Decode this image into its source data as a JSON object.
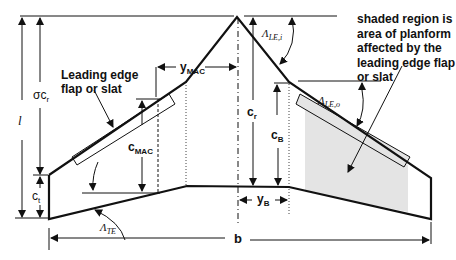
{
  "figure": {
    "type": "wing planform diagram (cranked delta with leading edge flap/slat)",
    "colors": {
      "line": "#111111",
      "shade": "#e6e6e6",
      "background": "#ffffff"
    }
  },
  "annotations": {
    "flap_label": [
      "Leading edge",
      "flap or slat"
    ],
    "shaded_note": [
      "shaded region is",
      "area of planform",
      "affected by the",
      "leading edge flap",
      "or slat"
    ]
  },
  "dimensions": {
    "l": "l",
    "sigma_cr": {
      "sym": "σc",
      "sub": "r"
    },
    "ct": {
      "sym": "c",
      "sub": "t"
    },
    "cmac": {
      "sym": "c",
      "sub": "MAC"
    },
    "ymac": {
      "sym": "y",
      "sub": "MAC"
    },
    "cr": {
      "sym": "c",
      "sub": "r"
    },
    "cb": {
      "sym": "c",
      "sub": "B"
    },
    "yb": {
      "sym": "y",
      "sub": "B"
    },
    "b": "b"
  },
  "angles": {
    "le_inner": {
      "sym": "Λ",
      "sub": "LE,i"
    },
    "le_outer": {
      "sym": "Λ",
      "sub": "LE,o"
    },
    "te": {
      "sym": "Λ",
      "sub": "TE"
    }
  }
}
